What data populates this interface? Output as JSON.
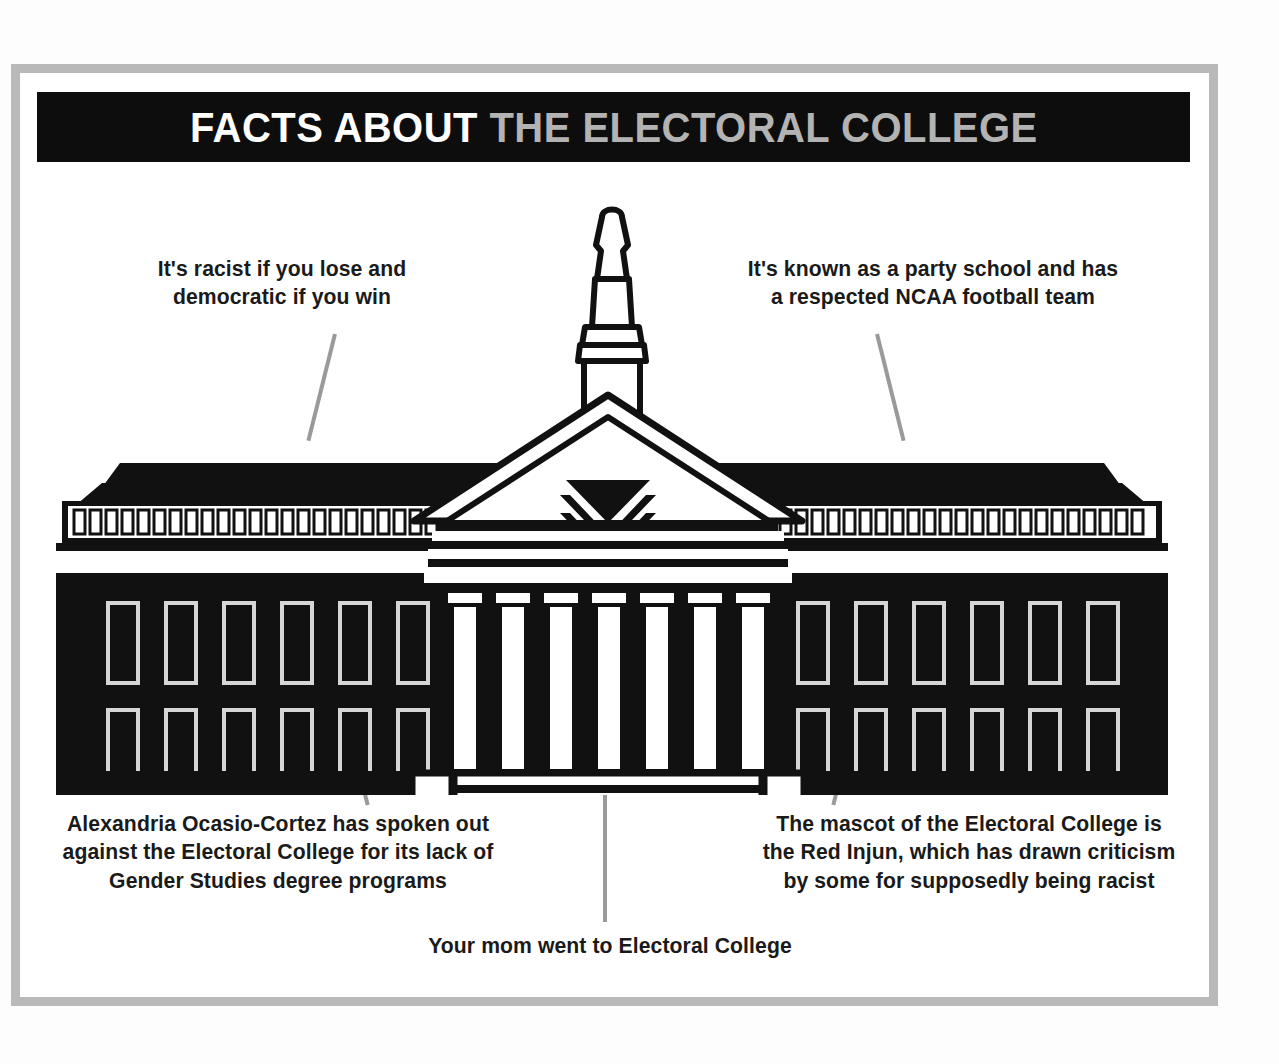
{
  "poster": {
    "title": {
      "part_highlight": "FACTS ABOUT",
      "part_normal": "THE ELECTORAL COLLEGE",
      "highlight_color": "#ffffff",
      "normal_color": "#b3b3b3",
      "bar_color": "#0d0d0d"
    },
    "frame": {
      "border_color": "#b9b9b9",
      "page_color": "#ffffff"
    },
    "callouts": [
      {
        "id": "top-left",
        "text": "It's racist if you lose and democratic if you win",
        "leader_color": "#9a9a9a"
      },
      {
        "id": "top-right",
        "text": "It's known as a party school and has a respected NCAA football team",
        "leader_color": "#9a9a9a"
      },
      {
        "id": "bottom-left",
        "text": "Alexandria Ocasio-Cortez has spoken out against the Electoral College for its lack of Gender Studies degree programs",
        "leader_color": "#9a9a9a"
      },
      {
        "id": "bottom-right",
        "text": "The mascot of the Electoral College is the Red Injun, which has drawn criticism by some for supposedly being racist",
        "leader_color": "#9a9a9a"
      },
      {
        "id": "bottom-center",
        "text": "Your mom went to Electoral College",
        "leader_color": "#9a9a9a"
      }
    ],
    "illustration": {
      "name": "neoclassical-college-building",
      "ink_color": "#111111",
      "paper_color": "#ffffff",
      "columns": 7,
      "window_rows": 2,
      "windows_per_row_per_wing": 6,
      "dentils_per_wing": 24,
      "step_count": 4,
      "has_cupola": true,
      "has_pediment_chevrons": true
    }
  }
}
